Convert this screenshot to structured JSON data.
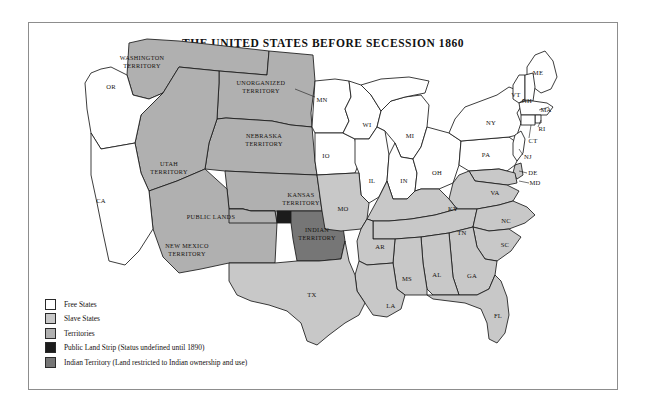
{
  "title": "THE UNITED STATES BEFORE SECESSION 1860",
  "colors": {
    "free": "#ffffff",
    "slave": "#c8c8c8",
    "territory": "#b0b0b0",
    "public_land_strip": "#1c1c1c",
    "indian_territory": "#767676",
    "outline": "#1a1a1a",
    "frame": "#8d8d8d",
    "background": "#ffffff",
    "text": "#15120f"
  },
  "legend": {
    "items": [
      {
        "label": "Free States",
        "swatch": "#ffffff",
        "category": "free"
      },
      {
        "label": "Slave States",
        "swatch": "#c8c8c8",
        "category": "slave"
      },
      {
        "label": "Territories",
        "swatch": "#b0b0b0",
        "category": "territory"
      },
      {
        "label": "Public Land Strip (Status undefined until 1890)",
        "swatch": "#1c1c1c",
        "category": "public_land_strip"
      },
      {
        "label": "Indian Territory (Land restricted to Indian ownership and use)",
        "swatch": "#767676",
        "category": "indian_territory"
      }
    ]
  },
  "map": {
    "free_states": [
      "OR",
      "CA",
      "MN",
      "IO",
      "WI",
      "MI",
      "IL",
      "IN",
      "OH",
      "PA",
      "NY",
      "ME",
      "VT",
      "NH",
      "MA",
      "RI",
      "CT",
      "NJ"
    ],
    "slave_states": [
      "TX",
      "AR",
      "LA",
      "MS",
      "AL",
      "GA",
      "FL",
      "SC",
      "NC",
      "TN",
      "KY",
      "VA",
      "MD",
      "DE",
      "MO"
    ],
    "territories": [
      "WASHINGTON TERRITORY",
      "UNORGANIZED TERRITORY",
      "NEBRASKA TERRITORY",
      "UTAH TERRITORY",
      "KANSAS TERRITORY",
      "NEW MEXICO TERRITORY",
      "PUBLIC LANDS"
    ],
    "special": [
      "INDIAN TERRITORY"
    ],
    "labels": [
      {
        "text": "WASHINGTON",
        "line2": "TERRITORY",
        "x": 113,
        "y": 40,
        "class": "terr"
      },
      {
        "text": "OR",
        "x": 82,
        "y": 64,
        "class": "st"
      },
      {
        "text": "CA",
        "x": 72,
        "y": 178,
        "class": "st"
      },
      {
        "text": "UNORGANIZED",
        "line2": "TERRITORY",
        "x": 232,
        "y": 65,
        "class": "terr"
      },
      {
        "text": "NEBRASKA",
        "line2": "TERRITORY",
        "x": 235,
        "y": 118,
        "class": "terr"
      },
      {
        "text": "UTAH",
        "line2": "TERRITORY",
        "x": 140,
        "y": 146,
        "class": "terr"
      },
      {
        "text": "KANSAS",
        "line2": "TERRITORY",
        "x": 272,
        "y": 177,
        "class": "terr"
      },
      {
        "text": "NEW MEXICO",
        "line2": "TERRITORY",
        "x": 158,
        "y": 228,
        "class": "terr"
      },
      {
        "text": "PUBLIC LANDS",
        "x": 182,
        "y": 195,
        "class": "terr"
      },
      {
        "text": "INDIAN",
        "line2": "TERRITORY",
        "x": 288,
        "y": 212,
        "class": "terr"
      },
      {
        "text": "MN",
        "x": 293,
        "y": 77,
        "class": "st"
      },
      {
        "text": "IO",
        "x": 297,
        "y": 133,
        "class": "st"
      },
      {
        "text": "WI",
        "x": 338,
        "y": 102,
        "class": "st"
      },
      {
        "text": "MI",
        "x": 381,
        "y": 113,
        "class": "st"
      },
      {
        "text": "MO",
        "x": 314,
        "y": 186,
        "class": "st"
      },
      {
        "text": "IL",
        "x": 343,
        "y": 158,
        "class": "st"
      },
      {
        "text": "IN",
        "x": 375,
        "y": 158,
        "class": "st"
      },
      {
        "text": "OH",
        "x": 408,
        "y": 150,
        "class": "st"
      },
      {
        "text": "PA",
        "x": 457,
        "y": 132,
        "class": "st"
      },
      {
        "text": "NY",
        "x": 462,
        "y": 100,
        "class": "st"
      },
      {
        "text": "ME",
        "x": 509,
        "y": 50,
        "class": "st"
      },
      {
        "text": "VT",
        "x": 487,
        "y": 72,
        "class": "st"
      },
      {
        "text": "NH",
        "x": 498,
        "y": 78,
        "class": "st"
      },
      {
        "text": "MA",
        "x": 517,
        "y": 87,
        "class": "st"
      },
      {
        "text": "RI",
        "x": 513,
        "y": 106,
        "class": "st"
      },
      {
        "text": "CT",
        "x": 504,
        "y": 118,
        "class": "st"
      },
      {
        "text": "NJ",
        "x": 499,
        "y": 134,
        "class": "st"
      },
      {
        "text": "DE",
        "x": 504,
        "y": 150,
        "class": "st"
      },
      {
        "text": "MD",
        "x": 506,
        "y": 160,
        "class": "st"
      },
      {
        "text": "VA",
        "x": 466,
        "y": 170,
        "class": "st"
      },
      {
        "text": "KY",
        "x": 424,
        "y": 186,
        "class": "st"
      },
      {
        "text": "TN",
        "x": 433,
        "y": 210,
        "class": "st"
      },
      {
        "text": "NC",
        "x": 477,
        "y": 198,
        "class": "st"
      },
      {
        "text": "SC",
        "x": 476,
        "y": 222,
        "class": "st"
      },
      {
        "text": "AR",
        "x": 351,
        "y": 224,
        "class": "st"
      },
      {
        "text": "MS",
        "x": 378,
        "y": 256,
        "class": "st"
      },
      {
        "text": "AL",
        "x": 408,
        "y": 252,
        "class": "st"
      },
      {
        "text": "GA",
        "x": 443,
        "y": 253,
        "class": "st"
      },
      {
        "text": "LA",
        "x": 362,
        "y": 283,
        "class": "st"
      },
      {
        "text": "FL",
        "x": 469,
        "y": 293,
        "class": "st"
      },
      {
        "text": "TX",
        "x": 283,
        "y": 272,
        "class": "st"
      }
    ]
  }
}
